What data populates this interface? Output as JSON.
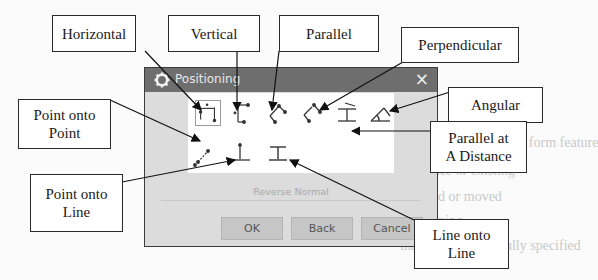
{
  "dialog": {
    "title": "Positioning",
    "close_icon": "×",
    "reverse_normal_label": "Reverse Normal",
    "buttons": {
      "ok": "OK",
      "back": "Back",
      "cancel": "Cancel"
    },
    "icons": [
      {
        "name": "horizontal",
        "selected": true
      },
      {
        "name": "vertical",
        "selected": false
      },
      {
        "name": "parallel",
        "selected": false
      },
      {
        "name": "perpendicular",
        "selected": false
      },
      {
        "name": "parallel-at-distance",
        "selected": false
      },
      {
        "name": "angular",
        "selected": false
      },
      {
        "name": "point-onto-point",
        "selected": false
      },
      {
        "name": "point-onto-line",
        "selected": false
      },
      {
        "name": "line-onto-line",
        "selected": false
      }
    ]
  },
  "callouts": {
    "horizontal": "Horizontal",
    "vertical": "Vertical",
    "parallel": "Parallel",
    "perpendicular": "Perpendicular",
    "angular": "Angular",
    "parallel_at_distance_1": "Parallel at",
    "parallel_at_distance_2": "A Distance",
    "point_onto_point_1": "Point onto",
    "point_onto_point_2": "Point",
    "point_onto_line_1": "Point onto",
    "point_onto_line_2": "Line",
    "line_onto_line_1": "Line onto",
    "line_onto_line_2": "Line"
  },
  "background_text": {
    "line1": "You may be creating a form feature",
    "line2": "reference or existing",
    "line3": "selected or moved",
    "line4": "positioning",
    "line5": "that the feature is fully specified"
  },
  "colors": {
    "titlebar": "#6e6e6e",
    "dialog_bg": "#dcdcdc",
    "button_bg": "#c6c6c6"
  }
}
